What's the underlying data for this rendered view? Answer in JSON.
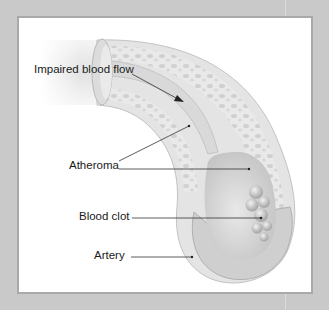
{
  "diagram": {
    "labels": [
      {
        "id": "impaired-blood-flow",
        "text": "Impaired blood flow"
      },
      {
        "id": "atheroma",
        "text": "Atheroma"
      },
      {
        "id": "blood-clot",
        "text": "Blood clot"
      },
      {
        "id": "artery",
        "text": "Artery"
      }
    ],
    "colors": {
      "background": "#c9c9c9",
      "panel": "#ffffff",
      "panel_border": "#a9a9a9",
      "vessel_light": "#ececec",
      "vessel_mid": "#d2d2d2",
      "vessel_dark": "#b4b4b4",
      "leader_line": "#333333"
    }
  }
}
